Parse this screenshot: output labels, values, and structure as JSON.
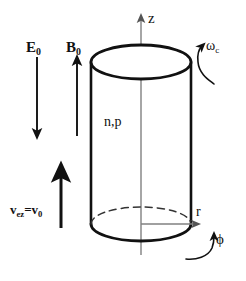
{
  "figure": {
    "background_color": "#ffffff",
    "stroke_color": "#111111",
    "axis_color": "#808080",
    "width": 246,
    "height": 281
  },
  "axes": {
    "z": {
      "label": "z",
      "direction": "up",
      "icon": "arrow-up-icon"
    },
    "r": {
      "label": "r",
      "direction": "right",
      "icon": "arrow-right-icon"
    },
    "phi": {
      "label": "ϕ",
      "direction": "azimuthal",
      "icon": "curved-arrow-icon"
    }
  },
  "fields": {
    "electric": {
      "symbol": "E",
      "subscript": "0",
      "direction": "down",
      "icon": "arrow-down-icon"
    },
    "magnetic": {
      "symbol": "B",
      "subscript": "0",
      "direction": "up",
      "icon": "arrow-up-icon"
    },
    "velocity": {
      "symbol": "v",
      "subscript": "ez",
      "equals": "=",
      "symbol2": "v",
      "subscript2": "0",
      "direction": "up",
      "icon": "arrow-up-icon"
    },
    "cyclotron": {
      "symbol": "ω",
      "subscript": "c",
      "icon": "curved-arrow-icon"
    }
  },
  "sample": {
    "carriers_label": "n,p",
    "shape": "cylinder"
  }
}
